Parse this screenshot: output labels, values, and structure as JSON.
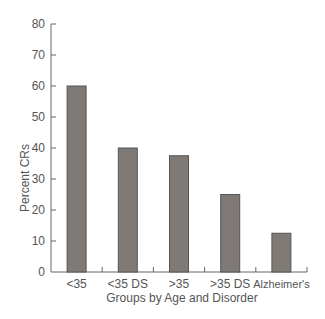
{
  "chart_data": {
    "type": "bar",
    "title": "",
    "xlabel": "Groups by Age and Disorder",
    "ylabel": "Percent CRs",
    "categories": [
      "<35",
      "<35 DS",
      ">35",
      ">35 DS",
      "Alzheimer's"
    ],
    "values": [
      60,
      40,
      37.5,
      25,
      12.5
    ],
    "ylim": [
      0,
      80
    ],
    "yticks": [
      0,
      10,
      20,
      30,
      40,
      50,
      60,
      70,
      80
    ],
    "grid": false,
    "legend": null,
    "bar_color": "#807a77",
    "bar_edge_color": "#555555"
  }
}
